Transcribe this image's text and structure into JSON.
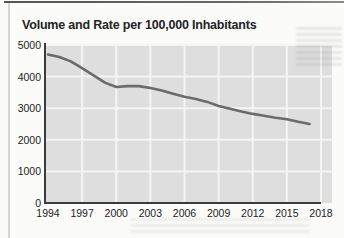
{
  "page": {
    "title": "Volume and Rate per 100,000 Inhabitants"
  },
  "chart_data": {
    "type": "line",
    "title": "Volume and Rate per 100,000 Inhabitants",
    "xlabel": "",
    "ylabel": "",
    "x": [
      1994,
      1995,
      1996,
      1997,
      1998,
      1999,
      2000,
      2001,
      2002,
      2003,
      2004,
      2005,
      2006,
      2007,
      2008,
      2009,
      2010,
      2011,
      2012,
      2013,
      2014,
      2015,
      2016,
      2017
    ],
    "values": [
      4700,
      4620,
      4480,
      4270,
      4040,
      3810,
      3670,
      3700,
      3700,
      3640,
      3560,
      3460,
      3360,
      3290,
      3200,
      3070,
      2980,
      2900,
      2820,
      2760,
      2700,
      2650,
      2570,
      2500
    ],
    "x_ticks": [
      1994,
      1997,
      2000,
      2003,
      2006,
      2009,
      2012,
      2015,
      2018
    ],
    "y_ticks": [
      0,
      1000,
      2000,
      3000,
      4000,
      5000
    ],
    "xlim": [
      1994,
      2018
    ],
    "ylim": [
      0,
      5000
    ],
    "grid": true,
    "legend": false
  },
  "colors": {
    "line": "#6b6b6b",
    "plot_bg": "#dedede",
    "grid": "#f4f4f2",
    "axis": "#3b3b3b",
    "text": "#1c1c1c",
    "page_bg": "#fbfbf9"
  }
}
